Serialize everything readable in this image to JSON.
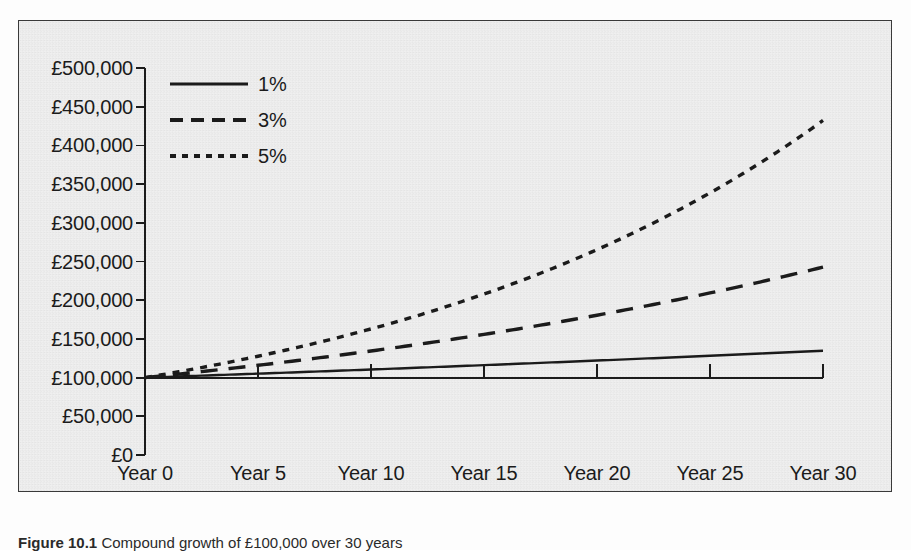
{
  "figure": {
    "caption_prefix": "Figure 10.1",
    "caption_text": "Compound growth of £100,000 over 30 years"
  },
  "chart_data": {
    "type": "line",
    "title": "",
    "xlabel": "",
    "ylabel": "",
    "x": [
      0,
      5,
      10,
      15,
      20,
      25,
      30
    ],
    "categories": [
      "Year 0",
      "Year 5",
      "Year 10",
      "Year 15",
      "Year 20",
      "Year 25",
      "Year 30"
    ],
    "xlim": [
      0,
      30
    ],
    "ylim": [
      0,
      500000
    ],
    "ytick_values": [
      0,
      50000,
      100000,
      150000,
      200000,
      250000,
      300000,
      350000,
      400000,
      450000,
      500000
    ],
    "ytick_labels": [
      "£0",
      "£50,000",
      "£100,000",
      "£150,000",
      "£200,000",
      "£250,000",
      "£300,000",
      "£350,000",
      "£400,000",
      "£450,000",
      "£500,000"
    ],
    "grid": false,
    "legend_position": "upper left",
    "axis_baseline_value": 100000,
    "currency_symbol": "£",
    "principal": 100000,
    "series": [
      {
        "name": "1%",
        "rate": 0.01,
        "style": "solid",
        "color": "#1b1b1b",
        "values": [
          100000,
          105101,
          110462,
          116097,
          122019,
          128243,
          134785
        ]
      },
      {
        "name": "3%",
        "rate": 0.03,
        "style": "dashed",
        "color": "#1b1b1b",
        "values": [
          100000,
          115927,
          134392,
          155797,
          180611,
          209378,
          242726
        ]
      },
      {
        "name": "5%",
        "rate": 0.05,
        "style": "dotted",
        "color": "#1b1b1b",
        "values": [
          100000,
          127628,
          162889,
          207893,
          265330,
          338635,
          432194
        ]
      }
    ]
  },
  "legend": {
    "items": [
      {
        "label": "1%",
        "style": "solid"
      },
      {
        "label": "3%",
        "style": "dashed"
      },
      {
        "label": "5%",
        "style": "dotted"
      }
    ]
  },
  "colors": {
    "ink": "#1b1b1b",
    "frame": "#3a3a3a",
    "paper": "#efefef"
  }
}
